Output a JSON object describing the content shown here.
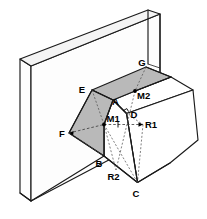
{
  "figure": {
    "background_color": "#ffffff",
    "line_color": "#1a1a1a",
    "shade_color": "#b9b9b9",
    "width": 207,
    "height": 219
  },
  "labels": {
    "G": "G",
    "E": "E",
    "M2": "M2",
    "A": "A",
    "D": "D",
    "M1": "M1",
    "R1": "R1",
    "F": "F",
    "B": "B",
    "R2": "R2",
    "C": "C"
  },
  "vertices": [
    {
      "id": "G",
      "label": "G",
      "x": 146.0,
      "y": 67.0,
      "label_x": 143.0,
      "label_y": 63.0,
      "dot": false
    },
    {
      "id": "E",
      "label": "E",
      "x": 92.0,
      "y": 90.0,
      "label_x": 82.0,
      "label_y": 89.0,
      "dot": false
    },
    {
      "id": "M2",
      "label": "M2",
      "x": 135.0,
      "y": 91.0,
      "label_x": 136.5,
      "label_y": 93.5,
      "dot": true
    },
    {
      "id": "A",
      "label": "A",
      "x": 113.0,
      "y": 100.0,
      "label_x": 111.0,
      "label_y": 101.0,
      "dot": false
    },
    {
      "id": "D",
      "label": "D",
      "x": 126.5,
      "y": 113.5,
      "label_x": 130.0,
      "label_y": 114.5,
      "dot": false
    },
    {
      "id": "M1",
      "label": "M1",
      "x": 104.0,
      "y": 124.5,
      "label_x": 106.5,
      "label_y": 124.0,
      "dot": true
    },
    {
      "id": "R1",
      "label": "R1",
      "x": 143.0,
      "y": 124.5,
      "label_x": 145.5,
      "label_y": 124.5,
      "dot": false
    },
    {
      "id": "F",
      "label": "F",
      "x": 69.0,
      "y": 133.0,
      "label_x": 62.0,
      "label_y": 135.5,
      "dot": false
    },
    {
      "id": "B",
      "label": "B",
      "x": 104.0,
      "y": 156.0,
      "label_x": 97.0,
      "label_y": 164.5,
      "dot": false
    },
    {
      "id": "R2",
      "label": "R2",
      "x": 116.0,
      "y": 170.0,
      "label_x": 110.5,
      "label_y": 178.0,
      "dot": false
    },
    {
      "id": "C",
      "label": "C",
      "x": 137.5,
      "y": 182.5,
      "label_x": 134.0,
      "label_y": 195.0,
      "dot": false
    }
  ],
  "faces": [
    {
      "name": "plate-front",
      "shaded": false
    },
    {
      "name": "plate-top",
      "shaded": false
    },
    {
      "name": "plate-side",
      "shaded": false
    },
    {
      "name": "wedge-top",
      "shaded": true
    },
    {
      "name": "wedge-left",
      "shaded": true
    },
    {
      "name": "block-front",
      "shaded": false
    },
    {
      "name": "block-right",
      "shaded": false
    }
  ],
  "markers": {
    "right_angle_at": "D",
    "midpoint_dots": [
      "M1",
      "M2"
    ]
  }
}
